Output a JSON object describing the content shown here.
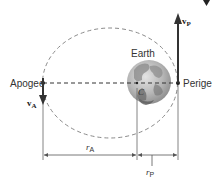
{
  "diagram": {
    "type": "orbit",
    "labels": {
      "apogee": "Apogee",
      "perigee": "Perigee",
      "earth": "Earth",
      "center": "C",
      "v_apogee_main": "v",
      "v_apogee_sub": "A",
      "v_perigee_main": "v",
      "v_perigee_sub": "P",
      "r_apogee_main": "r",
      "r_apogee_sub": "A",
      "r_perigee_main": "r",
      "r_perigee_sub": "P"
    },
    "colors": {
      "orbit": "#8a8a8a",
      "axis": "#333333",
      "arrow": "#333333",
      "earth_land": "#7d7d7d",
      "earth_sea": "#c8c8c8",
      "dimension": "#555555"
    }
  }
}
